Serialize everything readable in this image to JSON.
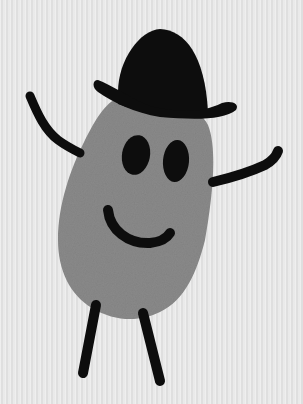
{
  "image": {
    "description": "Thumbprint character drawing: a gray fingerprint body wearing a black bowler hat, with two oval eyes, a smile, stick arms raised and stick legs",
    "colors": {
      "background": "#e6e6e6",
      "body": "#8a8a8a",
      "ink": "#111111"
    },
    "elements": [
      "bowler-hat",
      "thumbprint-body",
      "left-eye",
      "right-eye",
      "smile",
      "left-arm",
      "right-arm",
      "left-leg",
      "right-leg"
    ]
  }
}
